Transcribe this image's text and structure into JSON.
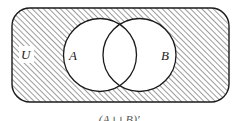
{
  "diagram": {
    "type": "venn",
    "universal_set": {
      "label": "U",
      "shaded": true,
      "shape": "rounded-rectangle",
      "x": 12,
      "y": 8,
      "width": 217,
      "height": 94,
      "corner_radius": 18
    },
    "sets": [
      {
        "label": "A",
        "cx": 100,
        "cy": 55,
        "r": 36.5,
        "label_x": 73,
        "label_y": 60
      },
      {
        "label": "B",
        "cx": 139.5,
        "cy": 55,
        "r": 36.5,
        "label_x": 162,
        "label_y": 60
      }
    ],
    "universal_label_pos": {
      "x": 26,
      "y": 59
    },
    "shaded_region": "outside A and B",
    "colors": {
      "stroke": "#1a1a1a",
      "hatch": "#3a3a3a",
      "background": "#ffffff"
    },
    "caption": "(A ∪ B)′"
  }
}
